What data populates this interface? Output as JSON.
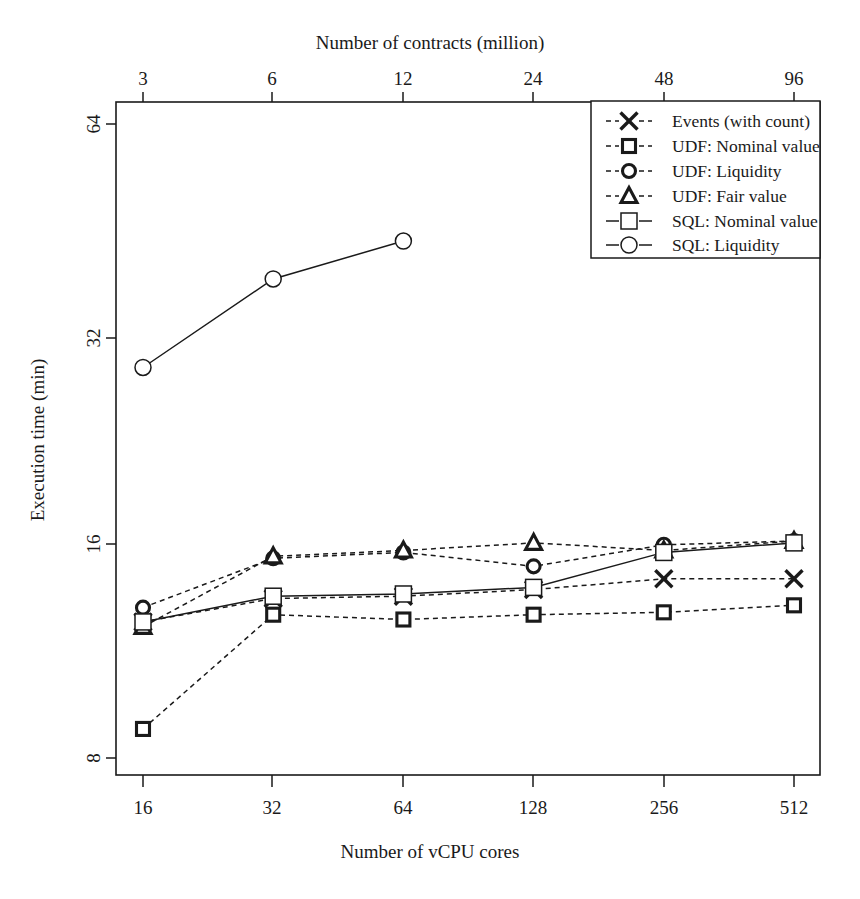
{
  "chart_data": {
    "type": "line",
    "title": "",
    "xlabel": "Number of vCPU cores",
    "ylabel": "Execution time (min)",
    "top_axis_label": "Number of contracts (million)",
    "x_scale": "log2",
    "y_scale": "log2",
    "grid": false,
    "legend_position": "top-right",
    "categories": [
      16,
      32,
      64,
      128,
      256,
      512
    ],
    "x_tick_labels": [
      "16",
      "32",
      "64",
      "128",
      "256",
      "512"
    ],
    "top_x_tick_labels": [
      "3",
      "6",
      "12",
      "24",
      "48",
      "96"
    ],
    "top_x_values": [
      3,
      6,
      12,
      24,
      48,
      96
    ],
    "y_tick_labels": [
      "8",
      "16",
      "32",
      "64"
    ],
    "y_ticks": [
      8,
      16,
      32,
      64
    ],
    "ylim": [
      7.1,
      72
    ],
    "xlim": [
      13.6,
      600
    ],
    "series": [
      {
        "name": "Events (with count)",
        "marker": "cross",
        "line": "dashed",
        "x": [
          16,
          32,
          64,
          128,
          256,
          512
        ],
        "values": [
          12.5,
          13.5,
          13.6,
          13.9,
          14.4,
          14.4
        ]
      },
      {
        "name": "UDF: Nominal value",
        "marker": "square-small",
        "line": "dashed",
        "x": [
          16,
          32,
          64,
          128,
          256,
          512
        ],
        "values": [
          8.8,
          12.8,
          12.6,
          12.8,
          12.9,
          13.2
        ]
      },
      {
        "name": "UDF: Liquidity",
        "marker": "circle-small",
        "line": "dashed",
        "x": [
          16,
          32,
          64,
          128,
          256,
          512
        ],
        "values": [
          13.1,
          15.4,
          15.7,
          15.0,
          16.1,
          16.3
        ]
      },
      {
        "name": "UDF: Fair value",
        "marker": "triangle",
        "line": "dashed",
        "x": [
          16,
          32,
          64,
          128,
          256,
          512
        ],
        "values": [
          12.3,
          15.5,
          15.8,
          16.2,
          15.8,
          16.3
        ]
      },
      {
        "name": "SQL: Nominal value",
        "marker": "square-large",
        "line": "solid",
        "x": [
          16,
          32,
          64,
          128,
          256,
          512
        ],
        "values": [
          12.5,
          13.6,
          13.7,
          14.0,
          15.7,
          16.2
        ]
      },
      {
        "name": "SQL: Liquidity",
        "marker": "circle-large",
        "line": "solid",
        "x": [
          16,
          32,
          64
        ],
        "values": [
          28.8,
          38.5,
          43.6
        ]
      }
    ]
  },
  "legend": {
    "entries": [
      {
        "label": "Events (with count)",
        "marker": "cross-icon",
        "line": "dashed"
      },
      {
        "label": "UDF: Nominal value",
        "marker": "square-small-icon",
        "line": "dashed"
      },
      {
        "label": "UDF: Liquidity",
        "marker": "circle-small-icon",
        "line": "dashed"
      },
      {
        "label": "UDF: Fair value",
        "marker": "triangle-icon",
        "line": "dashed"
      },
      {
        "label": "SQL: Nominal value",
        "marker": "square-large-icon",
        "line": "solid"
      },
      {
        "label": "SQL: Liquidity",
        "marker": "circle-large-icon",
        "line": "solid"
      }
    ]
  },
  "colors": {
    "ink": "#1a1a1a",
    "background": "#ffffff"
  }
}
